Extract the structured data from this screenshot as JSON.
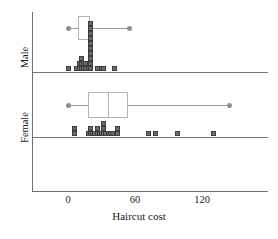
{
  "chart_data": {
    "type": "box",
    "title": "",
    "xlabel": "Haircut cost",
    "ylabel": "",
    "xlim": [
      -9,
      170
    ],
    "xticks": [
      0,
      60,
      120
    ],
    "xticklabels": [
      "0",
      "60",
      "120"
    ],
    "grid": false,
    "legend": "none",
    "groups": [
      {
        "name": "Male",
        "label": "Male",
        "box": {
          "min": 0,
          "q1": 9,
          "median": 20,
          "q3": 20,
          "max": 55
        },
        "dotplot_note": "stacked squares, each square = 1 observation",
        "dotplot_stacks": [
          {
            "value": 0,
            "count": 1
          },
          {
            "value": 8,
            "count": 1
          },
          {
            "value": 10,
            "count": 2
          },
          {
            "value": 12,
            "count": 3
          },
          {
            "value": 14,
            "count": 2
          },
          {
            "value": 16,
            "count": 2
          },
          {
            "value": 18,
            "count": 1
          },
          {
            "value": 20,
            "count": 10
          },
          {
            "value": 26,
            "count": 1
          },
          {
            "value": 30,
            "count": 1
          },
          {
            "value": 32,
            "count": 1
          },
          {
            "value": 42,
            "count": 1
          }
        ]
      },
      {
        "name": "Female",
        "label": "Female",
        "box": {
          "min": 0,
          "q1": 18,
          "median": 36,
          "q3": 54,
          "max": 145
        },
        "dotplot_note": "stacked squares, each square = 1 observation",
        "dotplot_stacks": [
          {
            "value": 6,
            "count": 2
          },
          {
            "value": 18,
            "count": 1
          },
          {
            "value": 20,
            "count": 2
          },
          {
            "value": 22,
            "count": 1
          },
          {
            "value": 24,
            "count": 1
          },
          {
            "value": 26,
            "count": 2
          },
          {
            "value": 28,
            "count": 1
          },
          {
            "value": 30,
            "count": 1
          },
          {
            "value": 32,
            "count": 3
          },
          {
            "value": 34,
            "count": 1
          },
          {
            "value": 36,
            "count": 1
          },
          {
            "value": 38,
            "count": 1
          },
          {
            "value": 40,
            "count": 1
          },
          {
            "value": 44,
            "count": 2
          },
          {
            "value": 72,
            "count": 1
          },
          {
            "value": 78,
            "count": 1
          },
          {
            "value": 98,
            "count": 1
          },
          {
            "value": 130,
            "count": 1
          }
        ]
      }
    ]
  },
  "axis": {
    "xlabel": "Haircut cost",
    "ticks": [
      {
        "label": "0"
      },
      {
        "label": "60"
      },
      {
        "label": "120"
      }
    ]
  },
  "groups": {
    "male_label": "Male",
    "female_label": "Female"
  }
}
